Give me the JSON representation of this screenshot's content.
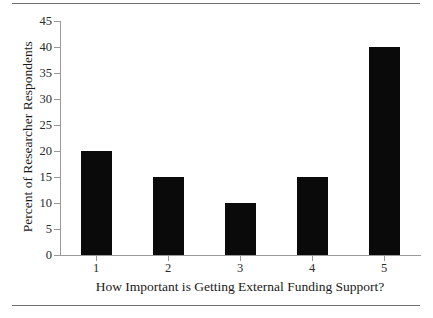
{
  "chart_data": {
    "type": "bar",
    "title": "",
    "subtitle": "",
    "categories": [
      "1",
      "2",
      "3",
      "4",
      "5"
    ],
    "values": [
      20,
      15,
      10,
      15,
      40
    ],
    "xlabel": "How Important is Getting External Funding Support?",
    "ylabel": "Percent of Researcher Respondents",
    "ylim": [
      0,
      45
    ],
    "yticks": [
      0,
      5,
      10,
      15,
      20,
      25,
      30,
      35,
      40,
      45
    ],
    "ytick_labels": [
      "0",
      "5",
      "10",
      "15",
      "20",
      "25",
      "30",
      "35",
      "40",
      "45"
    ],
    "xtick_labels": [
      "1",
      "2",
      "3",
      "4",
      "5"
    ],
    "grid": false,
    "legend": null,
    "bar_color": "#0a0a0a",
    "axis_color": "#9a9a9a",
    "rule_color": "#6f6f6f",
    "background": "#ffffff"
  },
  "figure": {
    "top_rule": "horizontal-rule",
    "bottom_rule": "horizontal-rule"
  }
}
